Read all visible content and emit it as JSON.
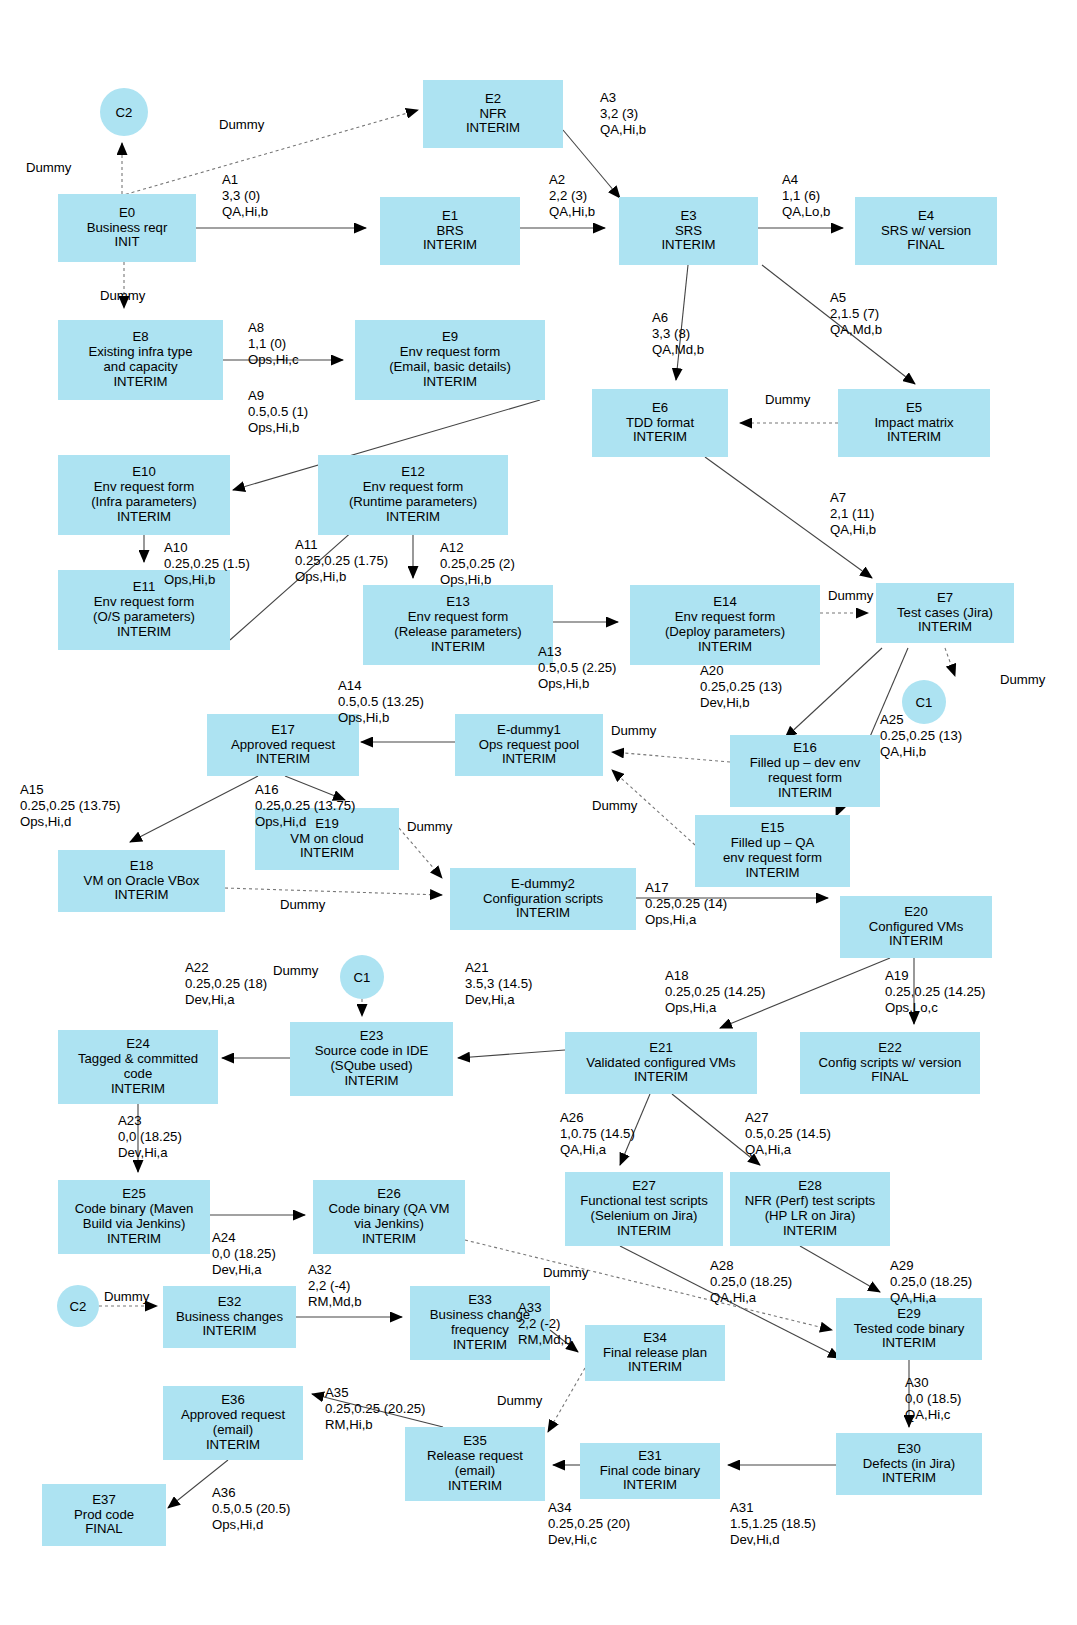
{
  "diagram": {
    "node_fill": "#ade3f2",
    "dummy_label": "Dummy"
  },
  "nodes": [
    {
      "id": "C2a",
      "kind": "circle",
      "lines": [
        "C2"
      ],
      "x": 100,
      "y": 88,
      "w": 48,
      "h": 48
    },
    {
      "id": "E2",
      "kind": "box",
      "lines": [
        "E2",
        "NFR",
        "INTERIM"
      ],
      "x": 423,
      "y": 80,
      "w": 140,
      "h": 68
    },
    {
      "id": "E0",
      "kind": "box",
      "lines": [
        "E0",
        "Business reqr",
        "INIT"
      ],
      "x": 58,
      "y": 194,
      "w": 138,
      "h": 68
    },
    {
      "id": "E1",
      "kind": "box",
      "lines": [
        "E1",
        "BRS",
        "INTERIM"
      ],
      "x": 380,
      "y": 197,
      "w": 140,
      "h": 68
    },
    {
      "id": "E3",
      "kind": "box",
      "lines": [
        "E3",
        "SRS",
        "INTERIM"
      ],
      "x": 619,
      "y": 197,
      "w": 139,
      "h": 68
    },
    {
      "id": "E4",
      "kind": "box",
      "lines": [
        "E4",
        "SRS w/ version",
        "FINAL"
      ],
      "x": 855,
      "y": 197,
      "w": 142,
      "h": 68
    },
    {
      "id": "E8",
      "kind": "box",
      "lines": [
        "E8",
        "Existing infra type",
        "and capacity",
        "INTERIM"
      ],
      "x": 58,
      "y": 320,
      "w": 165,
      "h": 80
    },
    {
      "id": "E9",
      "kind": "box",
      "lines": [
        "E9",
        "Env request form",
        "(Email, basic details)",
        "INTERIM"
      ],
      "x": 355,
      "y": 320,
      "w": 190,
      "h": 80
    },
    {
      "id": "E6",
      "kind": "box",
      "lines": [
        "E6",
        "TDD format",
        "INTERIM"
      ],
      "x": 592,
      "y": 389,
      "w": 136,
      "h": 68
    },
    {
      "id": "E5",
      "kind": "box",
      "lines": [
        "E5",
        "Impact matrix",
        "INTERIM"
      ],
      "x": 838,
      "y": 389,
      "w": 152,
      "h": 68
    },
    {
      "id": "E10",
      "kind": "box",
      "lines": [
        "E10",
        "Env request form",
        "(Infra parameters)",
        "INTERIM"
      ],
      "x": 58,
      "y": 455,
      "w": 172,
      "h": 80
    },
    {
      "id": "E12",
      "kind": "box",
      "lines": [
        "E12",
        "Env request form",
        "(Runtime parameters)",
        "INTERIM"
      ],
      "x": 318,
      "y": 455,
      "w": 190,
      "h": 80
    },
    {
      "id": "E11",
      "kind": "box",
      "lines": [
        "E11",
        "Env request form",
        "(O/S parameters)",
        "INTERIM"
      ],
      "x": 58,
      "y": 570,
      "w": 172,
      "h": 80
    },
    {
      "id": "E13",
      "kind": "box",
      "lines": [
        "E13",
        "Env request form",
        "(Release parameters)",
        "INTERIM"
      ],
      "x": 363,
      "y": 585,
      "w": 190,
      "h": 80
    },
    {
      "id": "E14",
      "kind": "box",
      "lines": [
        "E14",
        "Env request form",
        "(Deploy parameters)",
        "INTERIM"
      ],
      "x": 630,
      "y": 585,
      "w": 190,
      "h": 80
    },
    {
      "id": "E7",
      "kind": "box",
      "lines": [
        "E7",
        "Test cases (Jira)",
        "INTERIM"
      ],
      "x": 876,
      "y": 583,
      "w": 138,
      "h": 60
    },
    {
      "id": "C1a",
      "kind": "circle",
      "lines": [
        "C1"
      ],
      "x": 902,
      "y": 680,
      "w": 44,
      "h": 44
    },
    {
      "id": "E17",
      "kind": "box",
      "lines": [
        "E17",
        "Approved request",
        "INTERIM"
      ],
      "x": 207,
      "y": 714,
      "w": 152,
      "h": 62
    },
    {
      "id": "Edummy1",
      "kind": "box",
      "lines": [
        "E-dummy1",
        "Ops request pool",
        "INTERIM"
      ],
      "x": 455,
      "y": 714,
      "w": 148,
      "h": 62
    },
    {
      "id": "E16",
      "kind": "box",
      "lines": [
        "E16",
        "Filled up – dev env",
        "request form",
        "INTERIM"
      ],
      "x": 730,
      "y": 735,
      "w": 150,
      "h": 72
    },
    {
      "id": "E19",
      "kind": "box",
      "lines": [
        "E19",
        "VM on cloud",
        "INTERIM"
      ],
      "x": 255,
      "y": 808,
      "w": 144,
      "h": 62
    },
    {
      "id": "E15",
      "kind": "box",
      "lines": [
        "E15",
        "Filled up – QA",
        "env request form",
        "INTERIM"
      ],
      "x": 695,
      "y": 815,
      "w": 155,
      "h": 72
    },
    {
      "id": "E18",
      "kind": "box",
      "lines": [
        "E18",
        "VM on Oracle VBox",
        "INTERIM"
      ],
      "x": 58,
      "y": 850,
      "w": 167,
      "h": 62
    },
    {
      "id": "Edummy2",
      "kind": "box",
      "lines": [
        "E-dummy2",
        "Configuration scripts",
        "INTERIM"
      ],
      "x": 450,
      "y": 868,
      "w": 186,
      "h": 62
    },
    {
      "id": "E20",
      "kind": "box",
      "lines": [
        "E20",
        "Configured VMs",
        "INTERIM"
      ],
      "x": 840,
      "y": 896,
      "w": 152,
      "h": 62
    },
    {
      "id": "C1b",
      "kind": "circle",
      "lines": [
        "C1"
      ],
      "x": 340,
      "y": 955,
      "w": 44,
      "h": 44
    },
    {
      "id": "E23",
      "kind": "box",
      "lines": [
        "E23",
        "Source code in IDE",
        "(SQube used)",
        "INTERIM"
      ],
      "x": 290,
      "y": 1022,
      "w": 163,
      "h": 74
    },
    {
      "id": "E24",
      "kind": "box",
      "lines": [
        "E24",
        "Tagged & committed",
        "code",
        "INTERIM"
      ],
      "x": 58,
      "y": 1030,
      "w": 160,
      "h": 74
    },
    {
      "id": "E21",
      "kind": "box",
      "lines": [
        "E21",
        "Validated configured VMs",
        "INTERIM"
      ],
      "x": 565,
      "y": 1032,
      "w": 192,
      "h": 62
    },
    {
      "id": "E22",
      "kind": "box",
      "lines": [
        "E22",
        "Config scripts w/ version",
        "FINAL"
      ],
      "x": 800,
      "y": 1032,
      "w": 180,
      "h": 62
    },
    {
      "id": "E25",
      "kind": "box",
      "lines": [
        "E25",
        "Code binary (Maven",
        "Build via Jenkins)",
        "INTERIM"
      ],
      "x": 58,
      "y": 1180,
      "w": 152,
      "h": 74
    },
    {
      "id": "E26",
      "kind": "box",
      "lines": [
        "E26",
        "Code binary (QA VM",
        "via Jenkins)",
        "INTERIM"
      ],
      "x": 313,
      "y": 1180,
      "w": 152,
      "h": 74
    },
    {
      "id": "E27",
      "kind": "box",
      "lines": [
        "E27",
        "Functional test scripts",
        "(Selenium on Jira)",
        "INTERIM"
      ],
      "x": 565,
      "y": 1172,
      "w": 158,
      "h": 74
    },
    {
      "id": "E28",
      "kind": "box",
      "lines": [
        "E28",
        "NFR (Perf) test scripts",
        "(HP LR on Jira)",
        "INTERIM"
      ],
      "x": 730,
      "y": 1172,
      "w": 160,
      "h": 74
    },
    {
      "id": "C2b",
      "kind": "circle",
      "lines": [
        "C2"
      ],
      "x": 57,
      "y": 1285,
      "w": 42,
      "h": 42
    },
    {
      "id": "E32",
      "kind": "box",
      "lines": [
        "E32",
        "Business changes",
        "INTERIM"
      ],
      "x": 163,
      "y": 1286,
      "w": 133,
      "h": 62
    },
    {
      "id": "E33",
      "kind": "box",
      "lines": [
        "E33",
        "Business change",
        "frequency",
        "INTERIM"
      ],
      "x": 410,
      "y": 1286,
      "w": 140,
      "h": 74
    },
    {
      "id": "E34",
      "kind": "box",
      "lines": [
        "E34",
        "Final release plan",
        "INTERIM"
      ],
      "x": 585,
      "y": 1325,
      "w": 140,
      "h": 56
    },
    {
      "id": "E29",
      "kind": "box",
      "lines": [
        "E29",
        "Tested code binary",
        "INTERIM"
      ],
      "x": 836,
      "y": 1298,
      "w": 146,
      "h": 62
    },
    {
      "id": "E36",
      "kind": "box",
      "lines": [
        "E36",
        "Approved request",
        "(email)",
        "INTERIM"
      ],
      "x": 163,
      "y": 1386,
      "w": 140,
      "h": 74
    },
    {
      "id": "E35",
      "kind": "box",
      "lines": [
        "E35",
        "Release request",
        "(email)",
        "INTERIM"
      ],
      "x": 405,
      "y": 1427,
      "w": 140,
      "h": 74
    },
    {
      "id": "E31",
      "kind": "box",
      "lines": [
        "E31",
        "Final code binary",
        "INTERIM"
      ],
      "x": 580,
      "y": 1443,
      "w": 140,
      "h": 56
    },
    {
      "id": "E30",
      "kind": "box",
      "lines": [
        "E30",
        "Defects (in Jira)",
        "INTERIM"
      ],
      "x": 836,
      "y": 1433,
      "w": 146,
      "h": 62
    },
    {
      "id": "E37",
      "kind": "box",
      "lines": [
        "E37",
        "Prod code",
        "FINAL"
      ],
      "x": 42,
      "y": 1484,
      "w": 124,
      "h": 62
    }
  ],
  "activity_labels": [
    {
      "id": "A1",
      "x": 222,
      "y": 172,
      "lines": [
        "A1",
        "3,3 (0)",
        "QA,Hi,b"
      ]
    },
    {
      "id": "A2",
      "x": 549,
      "y": 172,
      "lines": [
        "A2",
        "2,2 (3)",
        "QA,Hi,b"
      ]
    },
    {
      "id": "A3",
      "x": 600,
      "y": 90,
      "lines": [
        "A3",
        "3,2 (3)",
        "QA,Hi,b"
      ]
    },
    {
      "id": "A4",
      "x": 782,
      "y": 172,
      "lines": [
        "A4",
        "1,1 (6)",
        "QA,Lo,b"
      ]
    },
    {
      "id": "A5",
      "x": 830,
      "y": 290,
      "lines": [
        "A5",
        "2,1.5 (7)",
        "QA,Md,b"
      ]
    },
    {
      "id": "A6",
      "x": 652,
      "y": 310,
      "lines": [
        "A6",
        "3,3 (8)",
        "QA,Md,b"
      ]
    },
    {
      "id": "A7",
      "x": 830,
      "y": 490,
      "lines": [
        "A7",
        "2,1 (11)",
        "QA,Hi,b"
      ]
    },
    {
      "id": "A8",
      "x": 248,
      "y": 320,
      "lines": [
        "A8",
        "1,1 (0)",
        "Ops,Hi,c"
      ]
    },
    {
      "id": "A9",
      "x": 248,
      "y": 388,
      "lines": [
        "A9",
        "0.5,0.5 (1)",
        "Ops,Hi,b"
      ]
    },
    {
      "id": "A10",
      "x": 164,
      "y": 540,
      "lines": [
        "A10",
        "0.25,0.25 (1.5)",
        "Ops,Hi,b"
      ]
    },
    {
      "id": "A11",
      "x": 295,
      "y": 537,
      "lines": [
        "A11",
        "0.25,0.25 (1.75)",
        "Ops,Hi,b"
      ]
    },
    {
      "id": "A12",
      "x": 440,
      "y": 540,
      "lines": [
        "A12",
        "0.25,0.25 (2)",
        "Ops,Hi,b"
      ]
    },
    {
      "id": "A13",
      "x": 538,
      "y": 644,
      "lines": [
        "A13",
        "0.5,0.5 (2.25)",
        "Ops,Hi,b"
      ]
    },
    {
      "id": "A14",
      "x": 338,
      "y": 678,
      "lines": [
        "A14",
        "0.5,0.5 (13.25)",
        "Ops,Hi,b"
      ]
    },
    {
      "id": "A15",
      "x": 20,
      "y": 782,
      "lines": [
        "A15",
        "0.25,0.25 (13.75)",
        "Ops,Hi,d"
      ]
    },
    {
      "id": "A16",
      "x": 255,
      "y": 782,
      "lines": [
        "A16",
        "0.25,0.25 (13.75)",
        "Ops,Hi,d"
      ]
    },
    {
      "id": "A17",
      "x": 645,
      "y": 880,
      "lines": [
        "A17",
        "0.25,0.25 (14)",
        "Ops,Hi,a"
      ]
    },
    {
      "id": "A18",
      "x": 665,
      "y": 968,
      "lines": [
        "A18",
        "0.25,0.25 (14.25)",
        "Ops,Hi,a"
      ]
    },
    {
      "id": "A19",
      "x": 885,
      "y": 968,
      "lines": [
        "A19",
        "0.25,0.25 (14.25)",
        "Ops,Lo,c"
      ]
    },
    {
      "id": "A20",
      "x": 700,
      "y": 663,
      "lines": [
        "A20",
        "0.25,0.25 (13)",
        "Dev,Hi,b"
      ]
    },
    {
      "id": "A21",
      "x": 465,
      "y": 960,
      "lines": [
        "A21",
        "3.5,3 (14.5)",
        "Dev,Hi,a"
      ]
    },
    {
      "id": "A22",
      "x": 185,
      "y": 960,
      "lines": [
        "A22",
        "0.25,0.25 (18)",
        "Dev,Hi,a"
      ]
    },
    {
      "id": "A23",
      "x": 118,
      "y": 1113,
      "lines": [
        "A23",
        "0,0 (18.25)",
        "Dev,Hi,a"
      ]
    },
    {
      "id": "A24",
      "x": 212,
      "y": 1230,
      "lines": [
        "A24",
        "0,0 (18.25)",
        "Dev,Hi,a"
      ]
    },
    {
      "id": "A25",
      "x": 880,
      "y": 712,
      "lines": [
        "A25",
        "0.25,0.25 (13)",
        "QA,Hi,b"
      ]
    },
    {
      "id": "A26",
      "x": 560,
      "y": 1110,
      "lines": [
        "A26",
        "1,0.75 (14.5)",
        "QA,Hi,a"
      ]
    },
    {
      "id": "A27",
      "x": 745,
      "y": 1110,
      "lines": [
        "A27",
        "0.5,0.25 (14.5)",
        "QA,Hi,a"
      ]
    },
    {
      "id": "A28",
      "x": 710,
      "y": 1258,
      "lines": [
        "A28",
        "0.25,0 (18.25)",
        "QA,Hi,a"
      ]
    },
    {
      "id": "A29",
      "x": 890,
      "y": 1258,
      "lines": [
        "A29",
        "0.25,0 (18.25)",
        "QA,Hi,a"
      ]
    },
    {
      "id": "A30",
      "x": 905,
      "y": 1375,
      "lines": [
        "A30",
        "0,0 (18.5)",
        "QA,Hi,c"
      ]
    },
    {
      "id": "A31",
      "x": 730,
      "y": 1500,
      "lines": [
        "A31",
        "1.5,1.25 (18.5)",
        "Dev,Hi,d"
      ]
    },
    {
      "id": "A32",
      "x": 308,
      "y": 1262,
      "lines": [
        "A32",
        "2,2 (-4)",
        "RM,Md,b"
      ]
    },
    {
      "id": "A33",
      "x": 518,
      "y": 1300,
      "lines": [
        "A33",
        "2,2 (-2)",
        "RM,Md,b"
      ]
    },
    {
      "id": "A34",
      "x": 548,
      "y": 1500,
      "lines": [
        "A34",
        "0.25,0.25 (20)",
        "Dev,Hi,c"
      ]
    },
    {
      "id": "A35",
      "x": 325,
      "y": 1385,
      "lines": [
        "A35",
        "0.25,0.25 (20.25)",
        "RM,Hi,b"
      ]
    },
    {
      "id": "A36",
      "x": 212,
      "y": 1485,
      "lines": [
        "A36",
        "0.5,0.5 (20.5)",
        "Ops,Hi,d"
      ]
    }
  ],
  "dummy_labels": [
    {
      "x": 26,
      "y": 160,
      "text": "Dummy"
    },
    {
      "x": 219,
      "y": 117,
      "text": "Dummy"
    },
    {
      "x": 100,
      "y": 288,
      "text": "Dummy"
    },
    {
      "x": 765,
      "y": 392,
      "text": "Dummy"
    },
    {
      "x": 828,
      "y": 588,
      "text": "Dummy"
    },
    {
      "x": 1000,
      "y": 672,
      "text": "Dummy"
    },
    {
      "x": 611,
      "y": 723,
      "text": "Dummy"
    },
    {
      "x": 592,
      "y": 798,
      "text": "Dummy"
    },
    {
      "x": 407,
      "y": 819,
      "text": "Dummy"
    },
    {
      "x": 280,
      "y": 897,
      "text": "Dummy"
    },
    {
      "x": 273,
      "y": 963,
      "text": "Dummy"
    },
    {
      "x": 543,
      "y": 1265,
      "text": "Dummy"
    },
    {
      "x": 104,
      "y": 1289,
      "text": "Dummy"
    },
    {
      "x": 497,
      "y": 1393,
      "text": "Dummy"
    }
  ]
}
